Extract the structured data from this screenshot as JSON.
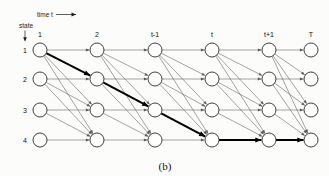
{
  "figure": {
    "caption": "(b)",
    "time_axis_label": "time t",
    "time_axis_arrow": "right-arrow-icon",
    "state_axis_label": "state",
    "state_axis_arrow": "down-arrow-icon"
  },
  "column_labels": [
    "1",
    "2",
    "t-1",
    "t",
    "t+1",
    "T"
  ],
  "row_labels": [
    "1",
    "2",
    "3",
    "4"
  ],
  "colors": {
    "background": "#fcfcfa",
    "node_stroke": "#2a2a2a",
    "node_fill": "#ffffff",
    "edge_thin": "#5a5a5a",
    "edge_bold": "#000000",
    "text": "#111111"
  },
  "chart_data": {
    "type": "diagram",
    "subtype": "trellis-lattice",
    "title": "(b)",
    "xlabel": "time t",
    "ylabel": "state",
    "columns": 6,
    "rows": 4,
    "column_ticks": [
      "1",
      "2",
      "t-1",
      "t",
      "t+1",
      "T"
    ],
    "row_ticks": [
      "1",
      "2",
      "3",
      "4"
    ],
    "node_grid_x": [
      40,
      97,
      155,
      212,
      269,
      311
    ],
    "node_grid_y": [
      50,
      79,
      110,
      140
    ],
    "node_radius": 7,
    "edge_rule": "from each node in column c to every node in column c+1 whose row index is greater than or equal to the source row index (horizontal plus downward transitions)",
    "highlighted_path": {
      "label": "best-path",
      "nodes": [
        {
          "column": 1,
          "row": 1
        },
        {
          "column": 2,
          "row": 2
        },
        {
          "column": 3,
          "row": 3
        },
        {
          "column": 4,
          "row": 4
        },
        {
          "column": 5,
          "row": 4
        },
        {
          "column": 6,
          "row": 4
        }
      ]
    }
  }
}
